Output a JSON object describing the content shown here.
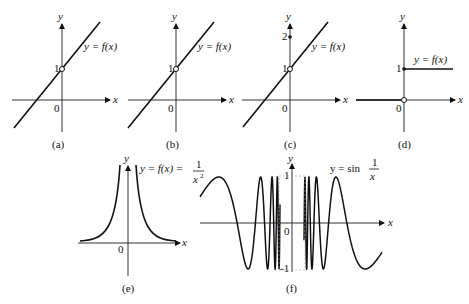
{
  "panels": [
    {
      "id": "a",
      "caption": "(a)",
      "func_label": "y = f(x)",
      "y_tick": "1",
      "origin": "0",
      "x_axis": "x",
      "y_axis": "y",
      "point": "open circle at (0,1)"
    },
    {
      "id": "b",
      "caption": "(b)",
      "func_label": "y = f(x)",
      "y_tick": "1",
      "origin": "0",
      "x_axis": "x",
      "y_axis": "y",
      "point": "open circle at (0,1)"
    },
    {
      "id": "c",
      "caption": "(c)",
      "func_label": "y = f(x)",
      "y_ticks": [
        "1",
        "2"
      ],
      "origin": "0",
      "x_axis": "x",
      "y_axis": "y",
      "point": "open circle at (0,1), filled dot at (0,2)"
    },
    {
      "id": "d",
      "caption": "(d)",
      "func_label": "y = f(x)",
      "y_tick": "1",
      "origin": "0",
      "x_axis": "x",
      "y_axis": "y",
      "point": "filled dot at (0,1), open circle at (0,0)"
    },
    {
      "id": "e",
      "caption": "(e)",
      "func_label": "y = f(x) = 1/x²",
      "origin": "0",
      "x_axis": "x",
      "y_axis": "y"
    },
    {
      "id": "f",
      "caption": "(f)",
      "func_label": "y = sin 1/x",
      "y_ticks": [
        "1",
        "-1"
      ],
      "origin": "0",
      "x_axis": "x",
      "y_axis": "y"
    }
  ],
  "text": {
    "a_cap": "(a)",
    "b_cap": "(b)",
    "c_cap": "(c)",
    "d_cap": "(d)",
    "e_cap": "(e)",
    "f_cap": "(f)",
    "yfx": "y = f(x)",
    "e_label": "y = f(x) = ",
    "e_num": "1",
    "e_den": "x",
    "e_exp": "2",
    "f_label": "y = sin ",
    "f_num": "1",
    "f_den": "x",
    "one": "1",
    "two": "2",
    "zero": "0",
    "neg_one": "-1",
    "x": "x",
    "y": "y"
  }
}
